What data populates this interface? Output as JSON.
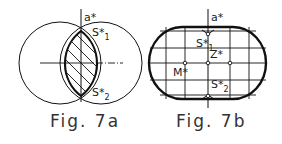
{
  "figures": [
    {
      "id": "fig7a",
      "caption": "Fig. 7a",
      "labels": {
        "axis": "a*",
        "s1": "S*",
        "s1_sub": "1",
        "s2": "S*",
        "s2_sub": "2"
      },
      "description": "Two overlapping circles with hatched lens-shaped intersection; vertical axis a* through intersection points S1 and S2"
    },
    {
      "id": "fig7b",
      "caption": "Fig. 7b",
      "labels": {
        "axis": "a*",
        "s1": "S*",
        "s1_sub": "1",
        "s2": "S*",
        "s2_sub": "2",
        "z": "Z*",
        "m": "M*"
      },
      "description": "Stadium-shaped outline with grid lines; axis a* with points S1, Z, S2 and point M"
    }
  ],
  "colors": {
    "line": "#111111",
    "background": "#ffffff"
  }
}
